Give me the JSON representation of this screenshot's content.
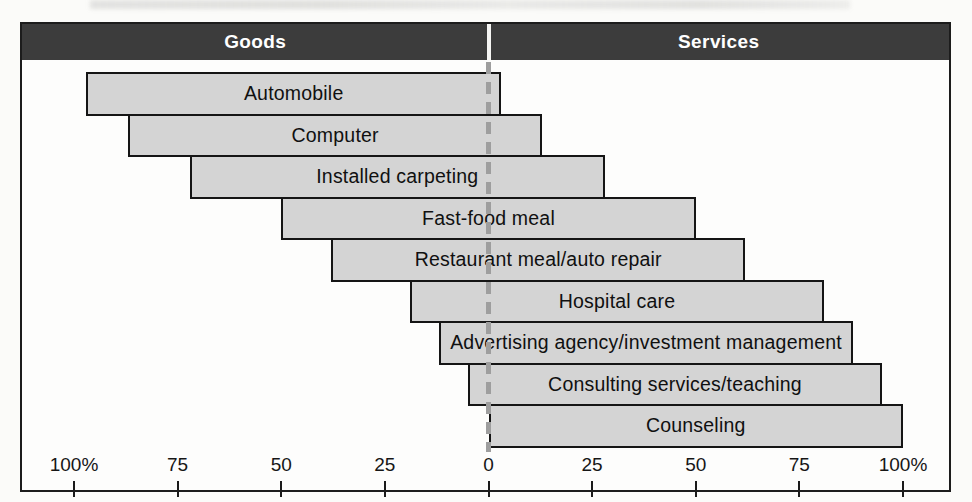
{
  "header": {
    "left_label": "Goods",
    "right_label": "Services"
  },
  "chart_data": {
    "type": "bar",
    "subtype": "goods-services-continuum",
    "orientation": "horizontal-diverging",
    "title": "",
    "axis": {
      "range": [
        -100,
        100
      ],
      "tick_labels": [
        "100%",
        "75",
        "50",
        "25",
        "0",
        "25",
        "50",
        "75",
        "100%"
      ],
      "tick_values": [
        -100,
        -75,
        -50,
        -25,
        0,
        25,
        50,
        75,
        100
      ],
      "grid": false
    },
    "bars": [
      {
        "label": "Automobile",
        "goods_pct": 97,
        "services_pct": 3
      },
      {
        "label": "Computer",
        "goods_pct": 87,
        "services_pct": 13
      },
      {
        "label": "Installed carpeting",
        "goods_pct": 72,
        "services_pct": 28
      },
      {
        "label": "Fast-food meal",
        "goods_pct": 50,
        "services_pct": 50
      },
      {
        "label": "Restaurant meal/auto repair",
        "goods_pct": 38,
        "services_pct": 62
      },
      {
        "label": "Hospital care",
        "goods_pct": 19,
        "services_pct": 81
      },
      {
        "label": "Advertising agency/investment management",
        "goods_pct": 12,
        "services_pct": 88
      },
      {
        "label": "Consulting services/teaching",
        "goods_pct": 5,
        "services_pct": 95
      },
      {
        "label": "Counseling",
        "goods_pct": 0,
        "services_pct": 100
      }
    ],
    "colors": {
      "header_bg": "#3c3c3c",
      "header_text": "#ffffff",
      "bar_fill": "#d4d4d4",
      "bar_border": "#151515",
      "dash_line": "#9e9e9e",
      "axis_text": "#161616"
    }
  }
}
